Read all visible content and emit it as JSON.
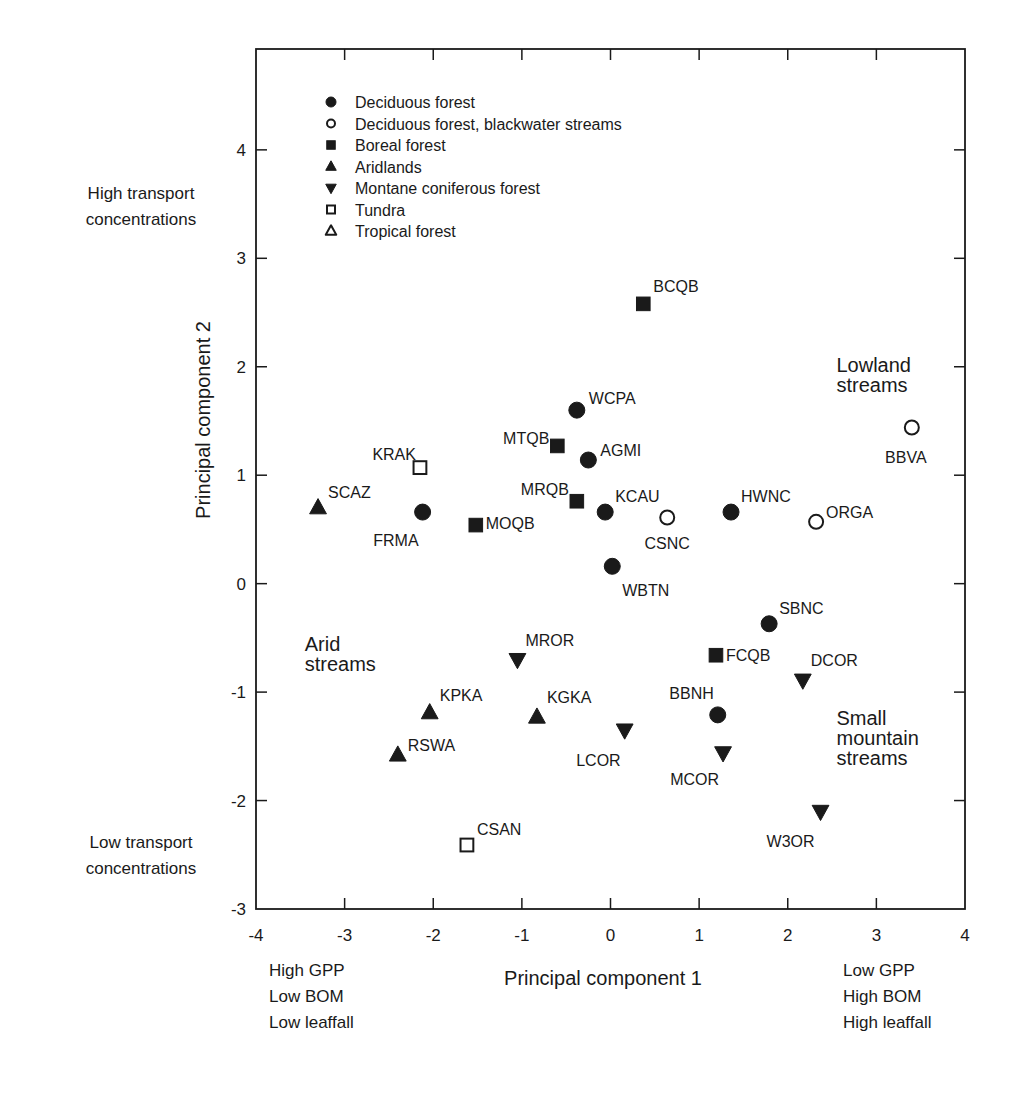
{
  "chart_data": {
    "type": "scatter",
    "title": "",
    "xlabel": "Principal component 1",
    "ylabel": "Principal component 2",
    "xlim": [
      -4,
      4
    ],
    "ylim": [
      -3,
      4.93
    ],
    "xticks": [
      -4,
      -3,
      -2,
      -1,
      0,
      1,
      2,
      3,
      4
    ],
    "yticks": [
      -3,
      -2,
      -1,
      0,
      1,
      2,
      3,
      4
    ],
    "grid": false,
    "legend_position": "upper left (inside)",
    "legend": [
      {
        "key": "deciduous",
        "label": "Deciduous forest",
        "marker": "circle",
        "filled": true
      },
      {
        "key": "blackwater",
        "label": "Deciduous forest, blackwater streams",
        "marker": "circle",
        "filled": false
      },
      {
        "key": "boreal",
        "label": "Boreal forest",
        "marker": "square",
        "filled": true
      },
      {
        "key": "aridlands",
        "label": "Aridlands",
        "marker": "triangle-up",
        "filled": true
      },
      {
        "key": "montane",
        "label": "Montane coniferous forest",
        "marker": "triangle-down",
        "filled": true
      },
      {
        "key": "tundra",
        "label": "Tundra",
        "marker": "square",
        "filled": false
      },
      {
        "key": "tropical",
        "label": "Tropical forest",
        "marker": "triangle-up",
        "filled": false
      }
    ],
    "points": [
      {
        "label": "BCQB",
        "group": "boreal",
        "x": 0.37,
        "y": 2.58,
        "lx": 10,
        "ly": -18,
        "anchor": "start"
      },
      {
        "label": "WCPA",
        "group": "deciduous",
        "x": -0.38,
        "y": 1.6,
        "lx": 12,
        "ly": -12,
        "anchor": "start"
      },
      {
        "label": "MTQB",
        "group": "boreal",
        "x": -0.6,
        "y": 1.27,
        "lx": -8,
        "ly": -8,
        "anchor": "end"
      },
      {
        "label": "AGMI",
        "group": "deciduous",
        "x": -0.25,
        "y": 1.14,
        "lx": 12,
        "ly": -10,
        "anchor": "start"
      },
      {
        "label": "KRAK",
        "group": "tundra",
        "x": -2.15,
        "y": 1.07,
        "lx": -4,
        "ly": -14,
        "anchor": "end"
      },
      {
        "label": "SCAZ",
        "group": "aridlands",
        "x": -3.3,
        "y": 0.7,
        "lx": 10,
        "ly": -16,
        "anchor": "start"
      },
      {
        "label": "FRMA",
        "group": "deciduous",
        "x": -2.12,
        "y": 0.66,
        "lx": -4,
        "ly": 28,
        "anchor": "end"
      },
      {
        "label": "MOQB",
        "group": "boreal",
        "x": -1.52,
        "y": 0.54,
        "lx": 10,
        "ly": -2,
        "anchor": "start"
      },
      {
        "label": "MRQB",
        "group": "boreal",
        "x": -0.38,
        "y": 0.76,
        "lx": -8,
        "ly": -12,
        "anchor": "end"
      },
      {
        "label": "KCAU",
        "group": "deciduous",
        "x": -0.06,
        "y": 0.66,
        "lx": 10,
        "ly": -16,
        "anchor": "start"
      },
      {
        "label": "CSNC",
        "group": "blackwater",
        "x": 0.64,
        "y": 0.61,
        "lx": 0,
        "ly": 26,
        "anchor": "middle"
      },
      {
        "label": "HWNC",
        "group": "deciduous",
        "x": 1.36,
        "y": 0.66,
        "lx": 10,
        "ly": -16,
        "anchor": "start"
      },
      {
        "label": "ORGA",
        "group": "blackwater",
        "x": 2.32,
        "y": 0.57,
        "lx": 10,
        "ly": -10,
        "anchor": "start"
      },
      {
        "label": "BBVA",
        "group": "blackwater",
        "x": 3.4,
        "y": 1.44,
        "lx": -6,
        "ly": 30,
        "anchor": "middle"
      },
      {
        "label": "WBTN",
        "group": "deciduous",
        "x": 0.02,
        "y": 0.16,
        "lx": 10,
        "ly": 24,
        "anchor": "start"
      },
      {
        "label": "SBNC",
        "group": "deciduous",
        "x": 1.79,
        "y": -0.37,
        "lx": 10,
        "ly": -16,
        "anchor": "start"
      },
      {
        "label": "FCQB",
        "group": "boreal",
        "x": 1.19,
        "y": -0.66,
        "lx": 10,
        "ly": 0,
        "anchor": "start"
      },
      {
        "label": "DCOR",
        "group": "montane",
        "x": 2.17,
        "y": -0.89,
        "lx": 8,
        "ly": -20,
        "anchor": "start"
      },
      {
        "label": "BBNH",
        "group": "deciduous",
        "x": 1.21,
        "y": -1.21,
        "lx": -4,
        "ly": -22,
        "anchor": "end"
      },
      {
        "label": "MCOR",
        "group": "montane",
        "x": 1.27,
        "y": -1.56,
        "lx": -4,
        "ly": 26,
        "anchor": "end"
      },
      {
        "label": "W3OR",
        "group": "montane",
        "x": 2.37,
        "y": -2.1,
        "lx": -6,
        "ly": 30,
        "anchor": "end"
      },
      {
        "label": "MROR",
        "group": "montane",
        "x": -1.05,
        "y": -0.7,
        "lx": 8,
        "ly": -20,
        "anchor": "start"
      },
      {
        "label": "KPKA",
        "group": "aridlands",
        "x": -2.04,
        "y": -1.19,
        "lx": 10,
        "ly": -18,
        "anchor": "start"
      },
      {
        "label": "KGKA",
        "group": "aridlands",
        "x": -0.83,
        "y": -1.23,
        "lx": 10,
        "ly": -20,
        "anchor": "start"
      },
      {
        "label": "LCOR",
        "group": "montane",
        "x": 0.16,
        "y": -1.35,
        "lx": -4,
        "ly": 30,
        "anchor": "end"
      },
      {
        "label": "RSWA",
        "group": "aridlands",
        "x": -2.4,
        "y": -1.58,
        "lx": 10,
        "ly": -10,
        "anchor": "start"
      },
      {
        "label": "CSAN",
        "group": "tundra",
        "x": -1.62,
        "y": -2.41,
        "lx": 10,
        "ly": -16,
        "anchor": "start"
      }
    ],
    "annotations": [
      {
        "key": "lowland",
        "lines": [
          "Lowland",
          "streams"
        ],
        "x": 2.55,
        "y": 1.95
      },
      {
        "key": "arid",
        "lines": [
          "Arid",
          "streams"
        ],
        "x": -3.45,
        "y": -0.62
      },
      {
        "key": "mountain",
        "lines": [
          "Small",
          "mountain",
          "streams"
        ],
        "x": 2.55,
        "y": -1.3
      }
    ]
  },
  "side_notes": {
    "y_high": [
      "High transport",
      "concentrations"
    ],
    "y_low": [
      "Low transport",
      "concentrations"
    ],
    "x_low": [
      "High GPP",
      "Low BOM",
      "Low leaffall"
    ],
    "x_high": [
      "Low GPP",
      "High BOM",
      "High leaffall"
    ]
  },
  "style": {
    "ink": "#1a1a1a",
    "background": "#ffffff"
  }
}
